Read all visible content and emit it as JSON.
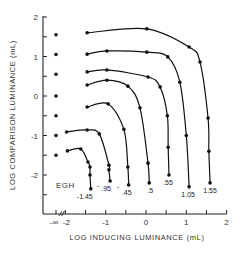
{
  "chart_data": {
    "type": "line",
    "title": "",
    "xlabel": "LOG INDUCING LUMINANCE (mL)",
    "ylabel": "LOG COMPARISON LUMINANCE (mL)",
    "xlim": [
      -2.5,
      2
    ],
    "ylim": [
      -3,
      2
    ],
    "x_ticks": [
      "-∞",
      "-2",
      "-1",
      "0",
      "1",
      "2"
    ],
    "y_ticks": [
      "2",
      "1",
      "0",
      "-1",
      "-2"
    ],
    "grid": false,
    "legend": "none; curves labeled at their lower ends",
    "annotation": "EGH",
    "minus_infinity_points": {
      "label": "-∞",
      "y": [
        1.55,
        1.05,
        0.55,
        0.0,
        -0.5,
        -1.0,
        -1.5
      ]
    },
    "series": [
      {
        "name": "1.55",
        "x": [
          -1.46,
          0.02,
          1.07,
          1.34,
          1.54,
          1.56,
          1.59
        ],
        "y": [
          1.6,
          1.7,
          1.24,
          0.86,
          -0.56,
          -1.4,
          -2.2
        ]
      },
      {
        "name": "1.05",
        "x": [
          -1.46,
          -0.97,
          0.02,
          0.54,
          0.84,
          1.0,
          1.07
        ],
        "y": [
          1.06,
          1.14,
          1.11,
          0.99,
          0.35,
          -1.0,
          -2.3
        ]
      },
      {
        "name": ".55",
        "x": [
          -1.46,
          -0.97,
          0.05,
          0.35,
          0.53,
          0.55,
          0.57
        ],
        "y": [
          0.61,
          0.66,
          0.48,
          0.23,
          -0.5,
          -1.3,
          -2.0
        ]
      },
      {
        "name": ".5",
        "x": [
          -1.46,
          -0.97,
          -0.45,
          -0.15,
          0.05,
          0.08
        ],
        "y": [
          0.28,
          0.4,
          0.25,
          -0.3,
          -1.7,
          -2.2
        ]
      },
      {
        "name": ".45",
        "x": [
          -1.46,
          -0.94,
          -0.55,
          -0.45,
          -0.43
        ],
        "y": [
          -0.28,
          -0.2,
          -0.84,
          -1.8,
          -2.25
        ]
      },
      {
        "name": ".95",
        "x": [
          -1.97,
          -1.46,
          -1.16,
          -0.92,
          -0.92,
          -0.89
        ],
        "y": [
          -0.91,
          -0.86,
          -0.96,
          -1.75,
          -1.87,
          -2.15
        ]
      },
      {
        "name": "-1.45",
        "x": [
          -1.95,
          -1.62,
          -1.44,
          -1.39,
          -1.39,
          -1.37
        ],
        "y": [
          -1.39,
          -1.34,
          -1.67,
          -1.8,
          -2.0,
          -2.35
        ]
      }
    ]
  },
  "labels": {
    "x_axis_title": "LOG INDUCING LUMINANCE (mL)",
    "y_axis_title": "LOG COMPARISON LUMINANCE (mL)",
    "subject": "EGH",
    "x_ticks": [
      "-∞",
      "-2",
      "-1",
      "0",
      "1",
      "2"
    ],
    "y_ticks": [
      "2",
      "1",
      "0",
      "-1",
      "-2"
    ],
    "curve_labels": [
      "-1.45",
      ".95",
      ".45",
      ".5",
      ".55",
      "1.05",
      "1.55"
    ]
  }
}
